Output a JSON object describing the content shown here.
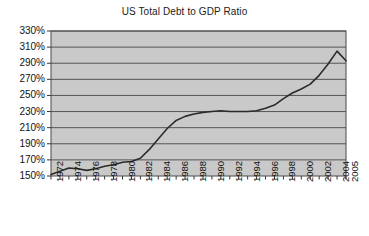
{
  "chart_data": {
    "type": "line",
    "title": "US Total Debt to GDP Ratio",
    "xlabel": "",
    "ylabel": "",
    "ylim": [
      150,
      330
    ],
    "ytick_step": 20,
    "grid": true,
    "legend": null,
    "series_color": "#2b2b2b",
    "plot_background": "#c9c9c9",
    "gridline_color": "#555555",
    "border_color": "#4a4a4a",
    "ytick_labels": [
      "330%",
      "310%",
      "290%",
      "270%",
      "250%",
      "230%",
      "210%",
      "190%",
      "170%",
      "150%"
    ],
    "ytick_values": [
      330,
      310,
      290,
      270,
      250,
      230,
      210,
      190,
      170,
      150
    ],
    "xtick_labels": [
      "1972",
      "1974",
      "1976",
      "1978",
      "1980",
      "1982",
      "1984",
      "1986",
      "1988",
      "1990",
      "1992",
      "1994",
      "1996",
      "1998",
      "2000",
      "2002",
      "2004",
      "2005"
    ],
    "x_range": [
      1972,
      2005
    ],
    "x": [
      1972,
      1973,
      1974,
      1975,
      1976,
      1977,
      1978,
      1979,
      1980,
      1981,
      1982,
      1983,
      1984,
      1985,
      1986,
      1987,
      1988,
      1989,
      1990,
      1991,
      1992,
      1993,
      1994,
      1995,
      1996,
      1997,
      1998,
      1999,
      2000,
      2001,
      2002,
      2003,
      2004,
      2005
    ],
    "values": [
      152,
      156,
      160,
      159,
      157,
      159,
      162,
      164,
      167,
      168,
      172,
      183,
      196,
      209,
      219,
      224,
      227,
      229,
      230,
      231,
      230,
      230,
      230,
      231,
      234,
      238,
      246,
      253,
      258,
      264,
      275,
      289,
      305,
      293
    ],
    "units": "percent of GDP"
  }
}
